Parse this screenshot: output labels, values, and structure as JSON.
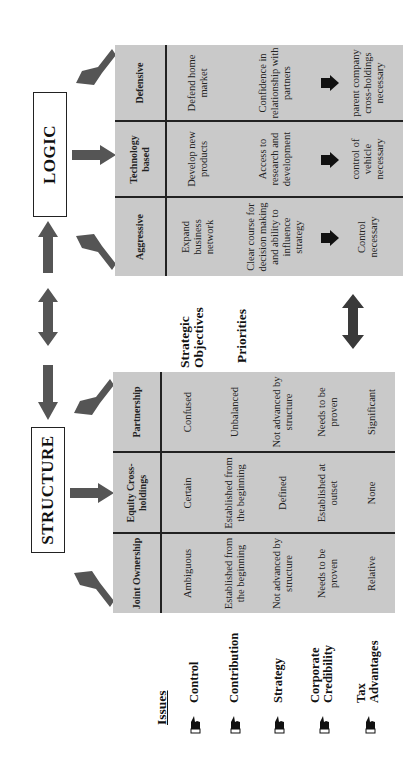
{
  "logic": {
    "title": "LOGIC",
    "columns": [
      {
        "header": "Aggressive",
        "objective": "Expand business network",
        "priority": "Clear course for decision making and ability to influence strategy",
        "outcome": "Control necessary"
      },
      {
        "header": "Technology based",
        "objective": "Develop new products",
        "priority": "Access to research and development",
        "outcome": "control of vehicle necessary"
      },
      {
        "header": "Defensive",
        "objective": "Defend home market",
        "priority": "Confidence in relationship with partners",
        "outcome": "parent company cross-holdings necessary"
      }
    ]
  },
  "structure": {
    "title": "STRUCTURE",
    "columns": [
      {
        "header": "Joint Ownership",
        "values": [
          "Ambiguous",
          "Established from the beginning",
          "Not advanced by structure",
          "Needs to be proven",
          "Relative"
        ]
      },
      {
        "header": "Equity Cross-holdings",
        "values": [
          "Certain",
          "Established from the beginning",
          "Defined",
          "Established at outset",
          "None"
        ]
      },
      {
        "header": "Partnership",
        "values": [
          "Confused",
          "Unbalanced",
          "Not advanced by structure",
          "Needs to be proven",
          "Significant"
        ]
      }
    ]
  },
  "middle_labels": {
    "strategic_objectives": "Strategic Objectives",
    "priorities": "Priorities"
  },
  "issues": {
    "heading": "Issues",
    "items": [
      "Control",
      "Contribution",
      "Strategy",
      "Corporate Credibility",
      "Tax Advantages"
    ],
    "icon": "pointing-hand-icon"
  },
  "colors": {
    "table_fill": "#c9c9c9",
    "arrow_fill": "#555555",
    "dark_arrow_fill": "#3a3a3a",
    "text": "#111111"
  }
}
